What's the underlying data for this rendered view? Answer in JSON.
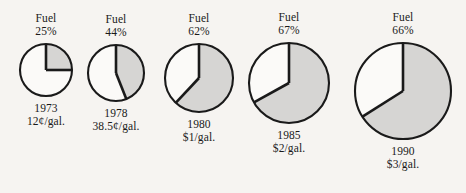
{
  "chart_data": {
    "type": "pie",
    "title": "",
    "subtitle": "",
    "xlabel": "",
    "ylabel": "",
    "legend_position": "none",
    "grid": false,
    "series_name": "Fuel",
    "note": "Small multiples: five pie charts, one per year. Shaded wedge = fuel share of cost, drawn clockwise from 12 o'clock. Circle diameter grows with fuel price.",
    "colors": {
      "wedge_fill": "#d6d5d3",
      "remainder_fill": "#fbfaf8",
      "stroke": "#1a1a1a",
      "background": "#f6f4f1",
      "text": "#1a1a1a"
    },
    "categories": [
      "1973",
      "1978",
      "1980",
      "1985",
      "1990"
    ],
    "values": [
      25,
      44,
      62,
      67,
      66
    ],
    "value_labels": [
      "25%",
      "44%",
      "62%",
      "67%",
      "66%"
    ],
    "price_labels": [
      "12¢/gal.",
      "38.5¢/gal.",
      "$1/gal.",
      "$2/gal.",
      "$3/gal."
    ],
    "prices_usd_per_gal": [
      0.12,
      0.385,
      1.0,
      2.0,
      3.0
    ],
    "diameters_px": [
      52,
      56,
      68,
      80,
      97
    ],
    "points": [
      {
        "label": "Fuel",
        "percent": 25,
        "percent_label": "25%",
        "year": "1973",
        "price": "12¢/gal.",
        "cx": 46,
        "cy": 70,
        "r": 26
      },
      {
        "label": "Fuel",
        "percent": 44,
        "percent_label": "44%",
        "year": "1978",
        "price": "38.5¢/gal.",
        "cx": 116,
        "cy": 73,
        "r": 28
      },
      {
        "label": "Fuel",
        "percent": 62,
        "percent_label": "62%",
        "year": "1980",
        "price": "$1/gal.",
        "cx": 199,
        "cy": 78,
        "r": 34
      },
      {
        "label": "Fuel",
        "percent": 67,
        "percent_label": "67%",
        "year": "1985",
        "price": "$2/gal.",
        "cx": 289,
        "cy": 83,
        "r": 40
      },
      {
        "label": "Fuel",
        "percent": 66,
        "percent_label": "66%",
        "year": "1990",
        "price": "$3/gal.",
        "cx": 403,
        "cy": 91,
        "r": 48
      }
    ]
  }
}
